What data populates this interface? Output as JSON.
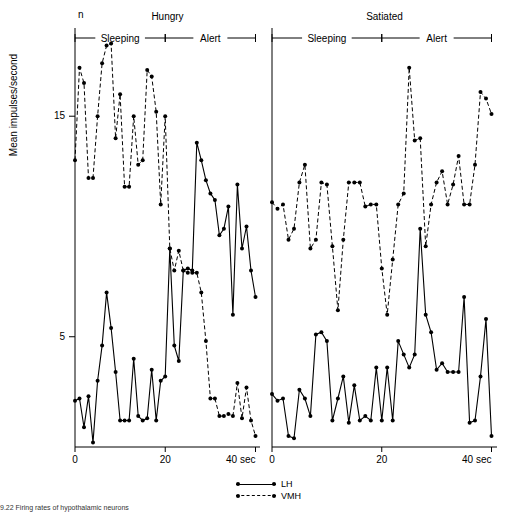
{
  "chart_data": {
    "type": "line",
    "title": "",
    "ylabel": "Mean impulses/second",
    "xlabel": "",
    "xlim": [
      0,
      41
    ],
    "ylim": [
      0,
      19
    ],
    "yticks": [
      5,
      15
    ],
    "ytick_labels": [
      "5",
      "15"
    ],
    "xticks": [
      0,
      20,
      40
    ],
    "xtick_labels": [
      "0",
      "20",
      "40 sec"
    ],
    "n_label": "n",
    "panels": [
      {
        "name": "Hungry",
        "title": "Hungry",
        "phases": [
          {
            "label": "Sleeping",
            "from": 0,
            "to": 20
          },
          {
            "label": "Alert",
            "from": 20,
            "to": 40
          }
        ],
        "series": [
          {
            "name": "LH",
            "style": "solid",
            "x": [
              0,
              1,
              2,
              3,
              4,
              5,
              6,
              7,
              8,
              9,
              10,
              11,
              12,
              13,
              14,
              15,
              16,
              17,
              18,
              19,
              20,
              21,
              22,
              23,
              24,
              25,
              26,
              27,
              28,
              29,
              30,
              31,
              32,
              33,
              34,
              35,
              36,
              37,
              38,
              39,
              40
            ],
            "y": [
              2.1,
              2.2,
              0.9,
              2.3,
              0.2,
              3.0,
              4.6,
              7.0,
              5.4,
              3.4,
              1.2,
              1.2,
              1.2,
              4.0,
              1.4,
              1.2,
              1.3,
              3.5,
              1.2,
              3.0,
              3.2,
              9.0,
              4.6,
              3.9,
              8.0,
              8.1,
              8.0,
              13.8,
              13.0,
              12.1,
              11.5,
              11.2,
              9.6,
              9.9,
              10.9,
              6.0,
              11.9,
              9.0,
              10.0,
              8.0,
              6.8
            ]
          },
          {
            "name": "VMH",
            "style": "dashed",
            "x": [
              0,
              1,
              2,
              3,
              4,
              5,
              6,
              7,
              8,
              9,
              10,
              11,
              12,
              13,
              14,
              15,
              16,
              17,
              18,
              19,
              20,
              21,
              22,
              23,
              24,
              25,
              26,
              27,
              28,
              29,
              30,
              31,
              32,
              33,
              34,
              35,
              36,
              37,
              38,
              39,
              40
            ],
            "y": [
              13.0,
              17.2,
              16.5,
              12.2,
              12.2,
              15.0,
              17.4,
              18.2,
              18.3,
              14.0,
              16.0,
              11.8,
              11.8,
              15.0,
              12.8,
              13.0,
              17.1,
              16.8,
              15.2,
              11.0,
              15.0,
              9.0,
              8.0,
              8.9,
              8.0,
              7.9,
              7.9,
              7.9,
              7.0,
              4.8,
              2.2,
              2.2,
              1.4,
              1.4,
              1.5,
              1.4,
              2.9,
              1.3,
              2.7,
              1.2,
              0.5
            ]
          }
        ]
      },
      {
        "name": "Satiated",
        "title": "Satiated",
        "phases": [
          {
            "label": "Sleeping",
            "from": 0,
            "to": 20
          },
          {
            "label": "Alert",
            "from": 20,
            "to": 40
          }
        ],
        "series": [
          {
            "name": "LH",
            "style": "solid",
            "x": [
              0,
              1,
              2,
              3,
              4,
              5,
              6,
              7,
              8,
              9,
              10,
              11,
              12,
              13,
              14,
              15,
              16,
              17,
              18,
              19,
              20,
              21,
              22,
              23,
              24,
              25,
              26,
              27,
              28,
              29,
              30,
              31,
              32,
              33,
              34,
              35,
              36,
              37,
              38,
              39,
              40
            ],
            "y": [
              2.4,
              2.1,
              2.2,
              0.5,
              0.4,
              2.6,
              2.2,
              1.4,
              5.1,
              5.2,
              4.8,
              1.2,
              2.2,
              3.2,
              1.1,
              2.8,
              1.2,
              1.4,
              1.2,
              3.6,
              1.2,
              3.6,
              1.2,
              4.8,
              4.2,
              3.6,
              4.2,
              9.9,
              6.0,
              5.2,
              3.5,
              3.8,
              3.4,
              3.4,
              3.4,
              6.8,
              1.1,
              1.2,
              3.2,
              5.8,
              0.5
            ]
          },
          {
            "name": "VMH",
            "style": "dashed",
            "x": [
              0,
              1,
              2,
              3,
              4,
              5,
              6,
              7,
              8,
              9,
              10,
              11,
              12,
              13,
              14,
              15,
              16,
              17,
              18,
              19,
              20,
              21,
              22,
              23,
              24,
              25,
              26,
              27,
              28,
              29,
              30,
              31,
              32,
              33,
              34,
              35,
              36,
              37,
              38,
              39,
              40
            ],
            "y": [
              11.1,
              10.8,
              11.0,
              9.4,
              9.9,
              12.0,
              12.8,
              9.0,
              9.4,
              12.0,
              11.9,
              9.1,
              6.2,
              9.4,
              12.0,
              12.0,
              12.0,
              10.9,
              11.0,
              11.0,
              8.1,
              6.0,
              8.5,
              11.0,
              11.5,
              17.2,
              13.9,
              14.0,
              9.1,
              11.0,
              12.0,
              12.5,
              11.0,
              11.9,
              13.2,
              11.0,
              11.0,
              12.8,
              16.1,
              15.8,
              15.1
            ]
          }
        ]
      }
    ],
    "legend": [
      {
        "label": "LH",
        "style": "solid"
      },
      {
        "label": "VMH",
        "style": "dashed"
      }
    ],
    "legend_position": "bottom-center"
  },
  "caption": "9.22  Firing rates of hypothalamic neurons"
}
